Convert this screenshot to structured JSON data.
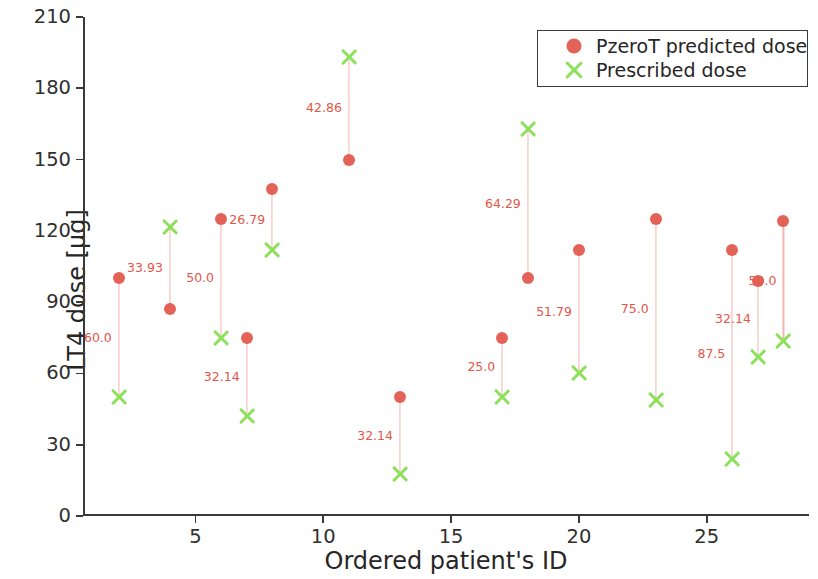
{
  "chart_data": {
    "type": "scatter",
    "title": "",
    "xlabel": "Ordered patient's ID",
    "ylabel": "LT4 dose [μg]",
    "xlim": [
      0.6,
      29.0
    ],
    "ylim": [
      0,
      210
    ],
    "xticks": [
      5,
      10,
      15,
      20,
      25
    ],
    "yticks": [
      0,
      30,
      60,
      90,
      120,
      150,
      180,
      210
    ],
    "grid": false,
    "legend_position": "top-right",
    "series": [
      {
        "name": "PzeroT predicted dose",
        "marker": "circle",
        "color": "#e2564a"
      },
      {
        "name": "Prescribed dose",
        "marker": "x",
        "color": "#8ce05a"
      }
    ],
    "x": [
      2,
      4,
      6,
      7,
      8,
      11,
      13,
      17,
      18,
      20,
      23,
      26,
      27,
      28
    ],
    "predicted": [
      100,
      87,
      125,
      75,
      137.5,
      150,
      50,
      75,
      100,
      112,
      125,
      112,
      99,
      124
    ],
    "prescribed": [
      50,
      121.5,
      75,
      42,
      112,
      193,
      17.5,
      50,
      163,
      60,
      49,
      24,
      67,
      73.5
    ],
    "annotations": [
      "60.0",
      "33.93",
      "50.0",
      "32.14",
      "26.79",
      "42.86",
      "32.14",
      "25.0",
      "64.29",
      "51.79",
      "75.0",
      "87.5",
      "32.14",
      "50.0"
    ]
  },
  "axes": {
    "ylabel": "LT4 dose [μg]",
    "xlabel": "Ordered patient's ID",
    "ytick_labels": [
      "0",
      "30",
      "60",
      "90",
      "120",
      "150",
      "180",
      "210"
    ],
    "xtick_labels": [
      "5",
      "10",
      "15",
      "20",
      "25"
    ]
  },
  "legend": {
    "items": [
      {
        "label": "PzeroT predicted dose",
        "icon": "filled-circle-marker"
      },
      {
        "label": "Prescribed dose",
        "icon": "x-cross-marker"
      }
    ]
  },
  "colors": {
    "predicted": "#e2564a",
    "prescribed": "#8ce05a",
    "connector": "#f3b4b0",
    "axis": "#3a3a3a",
    "text": "#262626",
    "background": "#ffffff"
  }
}
